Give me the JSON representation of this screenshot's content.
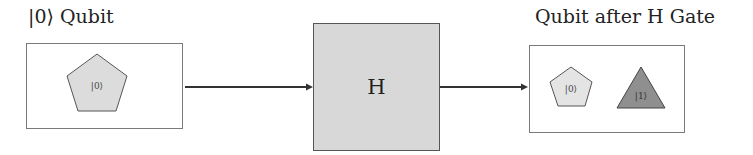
{
  "diagram": {
    "input": {
      "title": "|0⟩ Qubit",
      "shapes": [
        {
          "type": "pentagon",
          "label": "|0⟩",
          "fill": "#dcdcdc",
          "stroke": "#555555"
        }
      ]
    },
    "gate": {
      "label": "H",
      "fill": "#d8d8d8"
    },
    "output": {
      "title": "Qubit after H Gate",
      "shapes": [
        {
          "type": "pentagon",
          "label": "|0⟩",
          "fill": "#e4e4e4",
          "stroke": "#555555"
        },
        {
          "type": "triangle",
          "label": "|1⟩",
          "fill": "#8f8f8f",
          "stroke": "#444444"
        }
      ]
    },
    "arrows": [
      {
        "from": "input",
        "to": "gate"
      },
      {
        "from": "gate",
        "to": "output"
      }
    ]
  }
}
